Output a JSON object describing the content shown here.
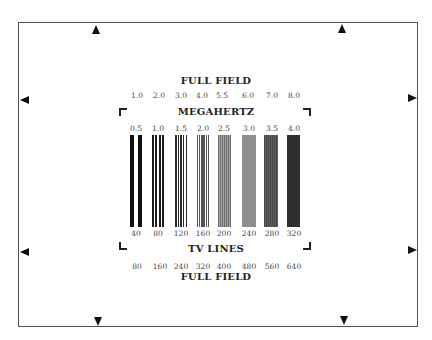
{
  "top_title": "FULL FIELD",
  "top_mhz_full": [
    "1.0",
    "2.0",
    "3.0",
    "4.0",
    "5.5",
    "6.0",
    "7.0",
    "8.0"
  ],
  "center_title": "MEGAHERTZ",
  "center_mhz": [
    "0.5",
    "1.0",
    "1.5",
    "2.0",
    "2.5",
    "3.0",
    "3.5",
    "4.0"
  ],
  "tv_lines_center": [
    "40",
    "80",
    "120",
    "160",
    "200",
    "240",
    "280",
    "320"
  ],
  "bottom_label": "TV LINES",
  "tv_lines_full": [
    "80",
    "160",
    "240",
    "320",
    "400",
    "480",
    "560",
    "640"
  ],
  "bottom_title": "FULL FIELD",
  "colors": {
    "frame": "#555555",
    "bar_dark": "#111111",
    "gray_2_5": "#8a8a8a",
    "gray_3_0": "#8e8e8e",
    "gray_3_5": "#555555",
    "gray_4_0": "#303030"
  }
}
